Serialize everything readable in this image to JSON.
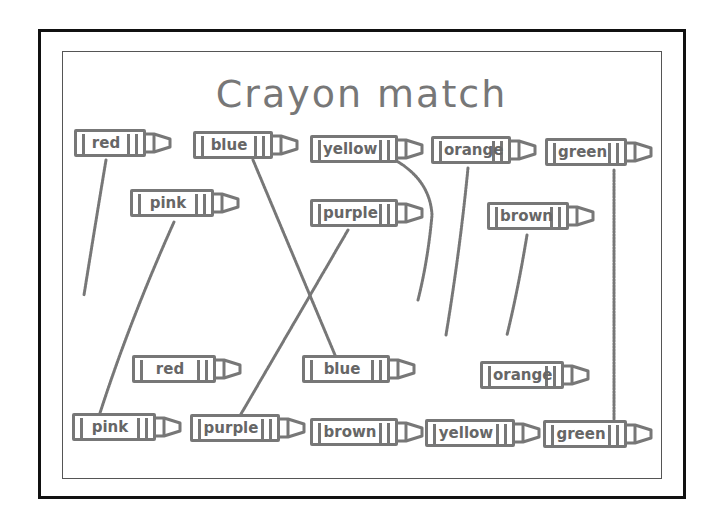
{
  "worksheet": {
    "title": "Crayon match",
    "top_row": [
      {
        "label": "red",
        "x": 74,
        "y": 129,
        "w": 72
      },
      {
        "label": "blue",
        "x": 193,
        "y": 131,
        "w": 80
      },
      {
        "label": "yellow",
        "x": 310,
        "y": 135,
        "w": 88
      },
      {
        "label": "orange",
        "x": 431,
        "y": 136,
        "w": 80
      },
      {
        "label": "green",
        "x": 545,
        "y": 138,
        "w": 82
      }
    ],
    "middle_top_row": [
      {
        "label": "pink",
        "x": 130,
        "y": 189,
        "w": 84
      },
      {
        "label": "purple",
        "x": 310,
        "y": 199,
        "w": 88
      },
      {
        "label": "brown",
        "x": 487,
        "y": 202,
        "w": 82
      }
    ],
    "middle_bottom_row": [
      {
        "label": "red",
        "x": 132,
        "y": 355,
        "w": 84
      },
      {
        "label": "blue",
        "x": 302,
        "y": 355,
        "w": 88
      },
      {
        "label": "orange",
        "x": 480,
        "y": 361,
        "w": 84
      }
    ],
    "bottom_row": [
      {
        "label": "pink",
        "x": 72,
        "y": 413,
        "w": 84
      },
      {
        "label": "purple",
        "x": 190,
        "y": 414,
        "w": 90
      },
      {
        "label": "brown",
        "x": 310,
        "y": 418,
        "w": 88
      },
      {
        "label": "yellow",
        "x": 425,
        "y": 419,
        "w": 90
      },
      {
        "label": "green",
        "x": 543,
        "y": 420,
        "w": 84
      }
    ]
  }
}
